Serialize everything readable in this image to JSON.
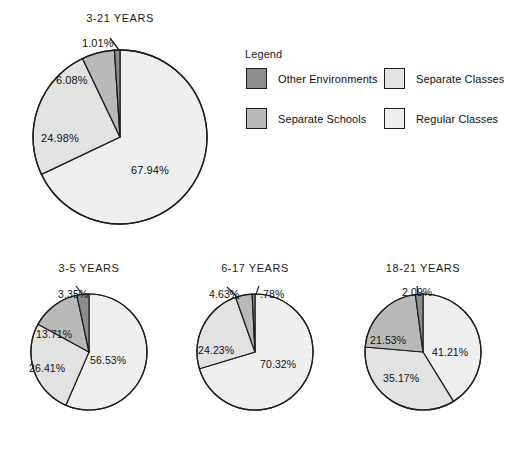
{
  "page": {
    "cutoff_header": "",
    "background": "#ffffff"
  },
  "legend": {
    "title": "Legend",
    "items": [
      {
        "label": "Other Environments",
        "color": "#8d8d8d"
      },
      {
        "label": "Separate Schools",
        "color": "#b9b9b9"
      },
      {
        "label": "Separate Classes",
        "color": "#e2e2e2"
      },
      {
        "label": "Regular Classes",
        "color": "#efefef"
      }
    ]
  },
  "colors": {
    "other_environments": "#8d8d8d",
    "separate_schools": "#b9b9b9",
    "separate_classes": "#e2e2e2",
    "regular_classes": "#efefef",
    "outline": "#1d1d1d",
    "text": "#111111"
  },
  "charts": {
    "main": {
      "title": "3-21 YEARS",
      "labels": {
        "regular_classes": "67.94%",
        "separate_classes": "24.98%",
        "separate_schools": "6.08%",
        "other_environments": "1.01%"
      }
    },
    "age_3_5": {
      "title": "3-5 YEARS",
      "labels": {
        "regular_classes": "56.53%",
        "separate_classes": "26.41%",
        "separate_schools": "13.71%",
        "other_environments": "3.35%"
      }
    },
    "age_6_17": {
      "title": "6-17 YEARS",
      "labels": {
        "regular_classes": "70.32%",
        "separate_classes": "24.23%",
        "separate_schools": "4.63%",
        "other_environments": ".78%"
      }
    },
    "age_18_21": {
      "title": "18-21 YEARS",
      "labels": {
        "regular_classes": "41.21%",
        "separate_classes": "35.17%",
        "separate_schools": "21.53%",
        "other_environments": "2.09%"
      }
    }
  },
  "chart_data": [
    {
      "type": "pie",
      "name": "3-21 YEARS",
      "title": "3-21 YEARS",
      "categories": [
        "Regular Classes",
        "Separate Classes",
        "Separate Schools",
        "Other Environments"
      ],
      "values": [
        67.94,
        24.98,
        6.08,
        1.01
      ],
      "value_labels": [
        "67.94%",
        "24.98%",
        "6.08%",
        "1.01%"
      ],
      "colors": [
        "#efefef",
        "#e2e2e2",
        "#b9b9b9",
        "#8d8d8d"
      ],
      "units": "percent",
      "start_angle_deg": 0,
      "direction": "clockwise",
      "legend_position": "right"
    },
    {
      "type": "pie",
      "name": "3-5 YEARS",
      "title": "3-5 YEARS",
      "categories": [
        "Regular Classes",
        "Separate Classes",
        "Separate Schools",
        "Other Environments"
      ],
      "values": [
        56.53,
        26.41,
        13.71,
        3.35
      ],
      "value_labels": [
        "56.53%",
        "26.41%",
        "13.71%",
        "3.35%"
      ],
      "colors": [
        "#efefef",
        "#e2e2e2",
        "#b9b9b9",
        "#8d8d8d"
      ],
      "units": "percent",
      "start_angle_deg": 0,
      "direction": "clockwise",
      "legend_position": "shared"
    },
    {
      "type": "pie",
      "name": "6-17 YEARS",
      "title": "6-17 YEARS",
      "categories": [
        "Regular Classes",
        "Separate Classes",
        "Separate Schools",
        "Other Environments"
      ],
      "values": [
        70.32,
        24.23,
        4.63,
        0.78
      ],
      "value_labels": [
        "70.32%",
        "24.23%",
        "4.63%",
        ".78%"
      ],
      "colors": [
        "#efefef",
        "#e2e2e2",
        "#b9b9b9",
        "#8d8d8d"
      ],
      "units": "percent",
      "start_angle_deg": 0,
      "direction": "clockwise",
      "legend_position": "shared"
    },
    {
      "type": "pie",
      "name": "18-21 YEARS",
      "title": "18-21 YEARS",
      "categories": [
        "Regular Classes",
        "Separate Classes",
        "Separate Schools",
        "Other Environments"
      ],
      "values": [
        41.21,
        35.17,
        21.53,
        2.09
      ],
      "value_labels": [
        "41.21%",
        "35.17%",
        "21.53%",
        "2.09%"
      ],
      "colors": [
        "#efefef",
        "#e2e2e2",
        "#b9b9b9",
        "#8d8d8d"
      ],
      "units": "percent",
      "start_angle_deg": 0,
      "direction": "clockwise",
      "legend_position": "shared"
    }
  ]
}
